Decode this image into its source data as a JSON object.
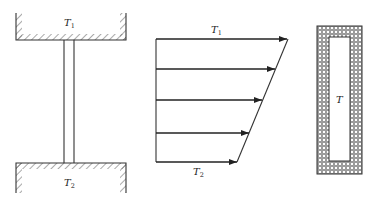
{
  "figure": {
    "panel_a": {
      "description": "Two reservoirs connected by a rod",
      "top_reservoir_label": {
        "symbol": "T",
        "subscript": "1"
      },
      "bottom_reservoir_label": {
        "symbol": "T",
        "subscript": "2"
      }
    },
    "panel_b": {
      "description": "Linear temperature/heat-flux profile with arrows",
      "top_label": {
        "symbol": "T",
        "subscript": "1"
      },
      "bottom_label": {
        "symbol": "T",
        "subscript": "2"
      },
      "arrow_count": 5
    },
    "panel_c": {
      "description": "Insulated enclosure at uniform temperature",
      "inner_label": "T"
    }
  },
  "colors": {
    "line": "#333333",
    "hatch": "#555555",
    "background": "#ffffff"
  }
}
